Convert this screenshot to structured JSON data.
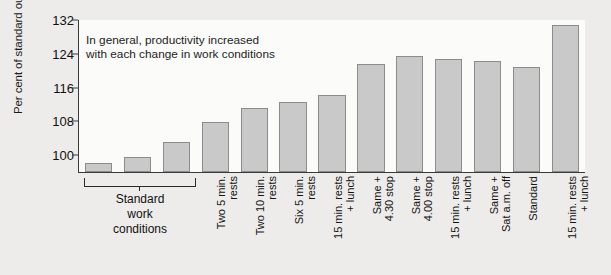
{
  "chart_data": {
    "type": "bar",
    "title": "",
    "xlabel": "",
    "ylabel": "Per cent of standard output",
    "ylim": [
      96,
      132
    ],
    "yticks": [
      100,
      108,
      116,
      124,
      132
    ],
    "grid": false,
    "legend": null,
    "annotations": [
      "In general, productivity increased\nwith each change in work conditions"
    ],
    "group_brackets": [
      {
        "label": "Standard\nwork\nconditions",
        "covers": [
          0,
          1,
          2
        ]
      }
    ],
    "categories": [
      "",
      "",
      "",
      "Two 5 min.\nrests",
      "Two 10 min.\nrests",
      "Six 5 min.\nrests",
      "15 min. rests\n+ lunch",
      "Same +\n4.30 stop",
      "Same +\n4.00 stop",
      "15 min. rests\n+ lunch",
      "Same +\nSat a.m. off",
      "Standard",
      "15 min. rests\n+ lunch"
    ],
    "values": [
      98.2,
      99.6,
      103.1,
      107.8,
      111.2,
      112.5,
      114.3,
      121.5,
      123.5,
      122.7,
      122.4,
      120.8,
      130.8
    ]
  },
  "colors": {
    "bar_fill": "#c9c9c9",
    "bar_edge": "#8c8c8c",
    "axis": "#3a3a3a",
    "figure_background": "#edecea",
    "plot_background": "#fbfbfa",
    "text": "#111111"
  }
}
